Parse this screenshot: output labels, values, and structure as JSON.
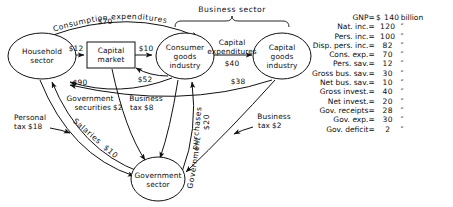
{
  "diagram": {
    "sector_brace_label": "Business sector",
    "nodes": [
      {
        "id": "household",
        "line1": "Household",
        "line2": "sector",
        "line3": ""
      },
      {
        "id": "capital-market",
        "line1": "Capital",
        "line2": "market",
        "line3": ""
      },
      {
        "id": "consumer-goods",
        "line1": "Consumer",
        "line2": "goods",
        "line3": "industry"
      },
      {
        "id": "capital-goods",
        "line1": "Capital",
        "line2": "goods",
        "line3": "industry"
      },
      {
        "id": "government",
        "line1": "Government",
        "line2": "sector",
        "line3": ""
      }
    ],
    "flows": [
      {
        "id": "consumption-expenditures",
        "label": "Consumption  expenditures",
        "amount": "$70"
      },
      {
        "id": "personal-saving",
        "label": "",
        "amount": "$12"
      },
      {
        "id": "capital-market-to-cgi",
        "label": "",
        "amount": "$10"
      },
      {
        "id": "capital-expenditures",
        "label_line1": "Capital",
        "label_line2": "expenditures",
        "amount": "$40"
      },
      {
        "id": "wages-from-cgi",
        "label": "",
        "amount": "$90"
      },
      {
        "id": "business-saving-cgi",
        "label": "",
        "amount": "$52"
      },
      {
        "id": "wages-from-capital-goods",
        "label": "",
        "amount": "$38"
      },
      {
        "id": "government-securities",
        "label_line1": "Government",
        "label_line2": "securities",
        "amount": "$2"
      },
      {
        "id": "business-tax-cgi",
        "label_line1": "Business",
        "label_line2": "tax",
        "amount": "$8"
      },
      {
        "id": "personal-tax",
        "label_line1": "Personal",
        "label_line2": "tax",
        "amount": "$18"
      },
      {
        "id": "salaries",
        "label": "Salaries",
        "amount": "$10"
      },
      {
        "id": "government-purchases",
        "label_line1": "Government",
        "label_line2": "purchases",
        "amount": "$20"
      },
      {
        "id": "business-tax-capital",
        "label_line1": "Business",
        "label_line2": "tax",
        "amount": "$2"
      }
    ]
  },
  "stats": {
    "rows": [
      {
        "name": "GNP",
        "eq": "=",
        "value": "$ 140",
        "unit": "billion"
      },
      {
        "name": "Nat. inc.",
        "eq": "=",
        "value": "120",
        "unit": "″"
      },
      {
        "name": "Pers. inc.",
        "eq": "=",
        "value": "100",
        "unit": "″"
      },
      {
        "name": "Disp. pers. inc.",
        "eq": "=",
        "value": "82",
        "unit": "″"
      },
      {
        "name": "Cons. exp.",
        "eq": "=",
        "value": "70",
        "unit": "″"
      },
      {
        "name": "Pers. sav.",
        "eq": "=",
        "value": "12",
        "unit": "″"
      },
      {
        "name": "Gross bus. sav.",
        "eq": "=",
        "value": "30",
        "unit": "″"
      },
      {
        "name": "Net bus. sav.",
        "eq": "=",
        "value": "10",
        "unit": "″"
      },
      {
        "name": "Gross invest.",
        "eq": "=",
        "value": "40",
        "unit": "″"
      },
      {
        "name": "Net invest.",
        "eq": "=",
        "value": "20",
        "unit": "″"
      },
      {
        "name": "Gov. receipts",
        "eq": "=",
        "value": "28",
        "unit": "″"
      },
      {
        "name": "Gov. exp.",
        "eq": "=",
        "value": "30",
        "unit": "″"
      },
      {
        "name": "Gov. deficit",
        "eq": "=",
        "value": "2",
        "unit": "″"
      }
    ]
  }
}
